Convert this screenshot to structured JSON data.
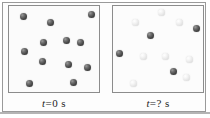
{
  "figure": {
    "width": 210,
    "height": 118,
    "colors": {
      "dark_sphere": "#3a3a3a",
      "light_sphere": "#e4e4e4",
      "box_border": "#8c8c8c",
      "box_fill": "#fbfbfb",
      "frame_border": "#9a9a9a",
      "caption_text": "#1c1c1c",
      "page_background": "#ffffff"
    }
  },
  "panels": [
    {
      "id": "left",
      "caption": "t = 0 s",
      "caption_parts": {
        "variable": "t",
        "equals": "=",
        "value": "0",
        "unit": "s"
      },
      "sphere_counts": {
        "dark": 12,
        "light": 0,
        "total": 12
      },
      "spheres": [
        {
          "kind": "dark",
          "x": 11,
          "y": 7,
          "d": 7
        },
        {
          "kind": "dark",
          "x": 38,
          "y": 13,
          "d": 7
        },
        {
          "kind": "dark",
          "x": 79,
          "y": 5,
          "d": 7
        },
        {
          "kind": "dark",
          "x": 31,
          "y": 33,
          "d": 7
        },
        {
          "kind": "dark",
          "x": 54,
          "y": 31,
          "d": 7
        },
        {
          "kind": "dark",
          "x": 68,
          "y": 33,
          "d": 7
        },
        {
          "kind": "dark",
          "x": 12,
          "y": 42,
          "d": 7
        },
        {
          "kind": "dark",
          "x": 30,
          "y": 52,
          "d": 7
        },
        {
          "kind": "dark",
          "x": 56,
          "y": 55,
          "d": 7
        },
        {
          "kind": "dark",
          "x": 75,
          "y": 58,
          "d": 7
        },
        {
          "kind": "dark",
          "x": 17,
          "y": 74,
          "d": 7
        },
        {
          "kind": "dark",
          "x": 61,
          "y": 73,
          "d": 7
        }
      ]
    },
    {
      "id": "right",
      "caption": "t = ? s",
      "caption_parts": {
        "variable": "t",
        "equals": "=",
        "value": "?",
        "unit": "s"
      },
      "sphere_counts": {
        "dark": 4,
        "light": 8,
        "total": 12
      },
      "spheres": [
        {
          "kind": "light",
          "x": 45,
          "y": 3,
          "d": 7
        },
        {
          "kind": "light",
          "x": 19,
          "y": 13,
          "d": 7
        },
        {
          "kind": "light",
          "x": 63,
          "y": 13,
          "d": 7
        },
        {
          "kind": "dark",
          "x": 80,
          "y": 19,
          "d": 7
        },
        {
          "kind": "dark",
          "x": 34,
          "y": 26,
          "d": 7
        },
        {
          "kind": "dark",
          "x": 3,
          "y": 44,
          "d": 7
        },
        {
          "kind": "light",
          "x": 27,
          "y": 47,
          "d": 7
        },
        {
          "kind": "light",
          "x": 49,
          "y": 47,
          "d": 7
        },
        {
          "kind": "light",
          "x": 73,
          "y": 50,
          "d": 7
        },
        {
          "kind": "dark",
          "x": 57,
          "y": 62,
          "d": 7
        },
        {
          "kind": "light",
          "x": 70,
          "y": 68,
          "d": 7
        },
        {
          "kind": "light",
          "x": 17,
          "y": 74,
          "d": 7
        }
      ]
    }
  ]
}
